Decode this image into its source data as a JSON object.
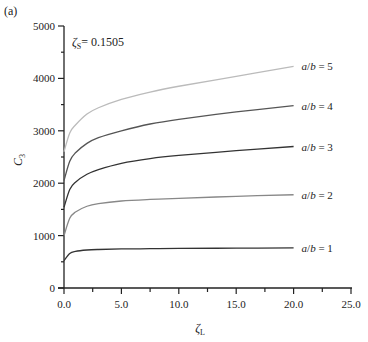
{
  "panel_label": "(a)",
  "annotation": {
    "symbol": "ζ",
    "sub": "S",
    "text": "= 0.1505"
  },
  "chart_data": {
    "type": "line",
    "title": "",
    "xlabel": "ζL",
    "ylabel": "C3",
    "xlim": [
      0,
      25
    ],
    "ylim": [
      0,
      5000
    ],
    "x_ticks": [
      "0.0",
      "5.0",
      "10.0",
      "15.0",
      "20.0",
      "25.0"
    ],
    "y_ticks": [
      "0",
      "1000",
      "2000",
      "3000",
      "4000",
      "5000"
    ],
    "grid": false,
    "legend": "inline labels at line ends",
    "x": [
      0,
      0.5,
      1,
      2,
      3,
      5,
      7.5,
      10,
      15,
      20
    ],
    "series": [
      {
        "name": "a/b = 1",
        "color": "#333333",
        "values": [
          520,
          660,
          700,
          725,
          735,
          745,
          750,
          755,
          760,
          765
        ]
      },
      {
        "name": "a/b = 2",
        "color": "#888888",
        "values": [
          1000,
          1330,
          1450,
          1560,
          1610,
          1660,
          1690,
          1710,
          1750,
          1780
        ]
      },
      {
        "name": "a/b = 3",
        "color": "#333333",
        "values": [
          1540,
          1880,
          2020,
          2170,
          2260,
          2380,
          2470,
          2530,
          2620,
          2700
        ]
      },
      {
        "name": "a/b = 4",
        "color": "#555555",
        "values": [
          2050,
          2420,
          2580,
          2760,
          2870,
          3000,
          3130,
          3220,
          3360,
          3480
        ]
      },
      {
        "name": "a/b = 5",
        "color": "#bbbbbb",
        "values": [
          2600,
          2960,
          3110,
          3320,
          3440,
          3600,
          3740,
          3850,
          4040,
          4230
        ]
      }
    ]
  },
  "labels": {
    "ab1": "a/b = 1",
    "ab2": "a/b = 2",
    "ab3": "a/b = 3",
    "ab4": "a/b = 4",
    "ab5": "a/b = 5"
  }
}
